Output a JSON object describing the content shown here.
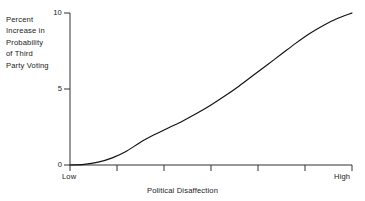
{
  "chart_data": {
    "type": "line",
    "title": "Probability of Third Party Voting",
    "xlabel": "Political Disaffection",
    "ylabel": "Percent Increase in Probability of Third Party Voting",
    "ylabel_lines": [
      "Percent",
      "Increase in",
      "Probability",
      "of Third",
      "Party Voting"
    ],
    "y_ticks": [
      0,
      5,
      10
    ],
    "y_tick_labels": [
      "0",
      "5",
      "10"
    ],
    "ylim": [
      0,
      10
    ],
    "x_tick_labels": [
      "Low",
      "High"
    ],
    "x_category_low": "Low",
    "x_category_high": "High",
    "x_tick_count": 7,
    "xlim": [
      0,
      1
    ],
    "grid": false,
    "legend": "none",
    "series": [
      {
        "name": "Percent Increase in Probability of Third Party Voting",
        "color": "#111111",
        "x": [
          0.0,
          0.05,
          0.1,
          0.15,
          0.2,
          0.25,
          0.3,
          0.35,
          0.4,
          0.45,
          0.5,
          0.55,
          0.6,
          0.65,
          0.7,
          0.75,
          0.8,
          0.85,
          0.9,
          0.95,
          1.0
        ],
        "values": [
          0.0,
          0.04,
          0.19,
          0.47,
          0.91,
          1.5,
          2.0,
          2.45,
          2.9,
          3.4,
          3.95,
          4.55,
          5.2,
          5.9,
          6.6,
          7.3,
          8.0,
          8.65,
          9.2,
          9.65,
          10.0
        ]
      }
    ]
  },
  "axes": {
    "y_tick_10": "10",
    "y_tick_5": "5",
    "y_tick_0": "0",
    "x_low": "Low",
    "x_high": "High",
    "x_title": "Political Disaffection"
  },
  "ylabel": {
    "line1": "Percent",
    "line2": "Increase in",
    "line3": "Probability",
    "line4": "of Third",
    "line5": "Party Voting"
  },
  "title": {
    "text": "Probability of Third Party Voting"
  },
  "colors": {
    "curve": "#111111",
    "axis": "#333333",
    "text": "#1a1a1a"
  }
}
